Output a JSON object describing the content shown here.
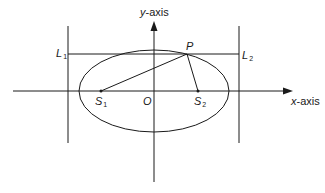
{
  "diagram": {
    "colors": {
      "stroke": "#1a1a1a",
      "background": "#ffffff"
    },
    "axes": {
      "x_label": {
        "var": "x",
        "suffix": "-axis"
      },
      "y_label": {
        "var": "y",
        "suffix": "-axis"
      }
    },
    "points": {
      "origin": {
        "name": "O"
      },
      "focus1": {
        "name": "S",
        "sub": "1"
      },
      "focus2": {
        "name": "S",
        "sub": "2"
      },
      "point": {
        "name": "P"
      }
    },
    "lines": {
      "directrix1": {
        "name": "L",
        "sub": "1"
      },
      "directrix2": {
        "name": "L",
        "sub": "2"
      }
    },
    "geometry": {
      "center": [
        154,
        91
      ],
      "rx": 75,
      "ry": 41,
      "S1": [
        101,
        91
      ],
      "S2": [
        198,
        91
      ],
      "P": [
        187,
        54
      ],
      "L1_x": 68,
      "L2_x": 239
    }
  }
}
